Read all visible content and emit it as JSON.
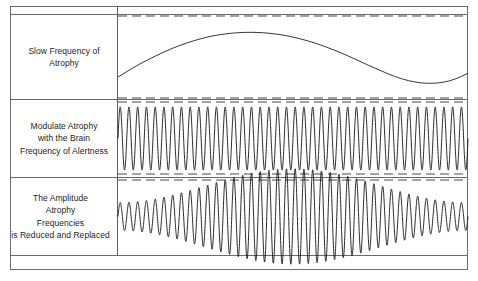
{
  "figure": {
    "frame_color": "#6b6b6b",
    "wave_color": "#141414",
    "guide_color": "#4a4a4a",
    "background": "#ffffff"
  },
  "rows": [
    {
      "id": "slow-frequency",
      "label_lines": [
        "Slow Frequency of",
        "Atrophy"
      ],
      "label": "Slow Frequency of Atrophy",
      "wave": {
        "kind": "sine",
        "cycles": 1,
        "amplitude_rel": 0.38,
        "phase_deg": -90,
        "baseline_rel": 0.5
      },
      "guides": [
        "top",
        "bottom"
      ]
    },
    {
      "id": "brain-frequency-alertness",
      "label_lines": [
        "Modulate Atrophy",
        "with the Brain",
        "Frequency of Alertness"
      ],
      "label": "Modulate Atrophy with the Brain Frequency of Alertness",
      "wave": {
        "kind": "carrier",
        "cycles": 40,
        "amplitude_rel": 0.41,
        "baseline_rel": 0.5
      },
      "guides": [
        "top",
        "bottom"
      ]
    },
    {
      "id": "amplitude-reduced-replaced",
      "label_lines": [
        "The Amplitude",
        "Atrophy",
        "Frequencies",
        "is Reduced and Replaced"
      ],
      "label": "The Amplitude Atrophy Frequencies is Reduced and Replaced",
      "wave": {
        "kind": "amplitude-modulated",
        "carrier_cycles": 40,
        "envelope_cycles": 1,
        "envelope_min_rel": 0.18,
        "envelope_max_rel": 0.62,
        "envelope_phase_deg": -90,
        "baseline_rel": 0.5
      },
      "guides": [
        "top"
      ]
    }
  ],
  "chart_data": {
    "type": "line",
    "xlabel": "",
    "ylabel": "",
    "grid": false,
    "legend": "none",
    "x": [
      0,
      0.25,
      0.5,
      0.75,
      1.0
    ],
    "series": [
      {
        "name": "Slow Frequency of Atrophy",
        "row": 1,
        "description": "One full slow sine cycle: rises from low-left to a broad peak near x=0.3, falls to a trough near x=0.78, then rises again at the right edge.",
        "values": [
          -0.62,
          0.92,
          0.1,
          -0.95,
          -0.2
        ],
        "ylim": [
          -1,
          1
        ]
      },
      {
        "name": "Brain Frequency of Alertness (carrier)",
        "row": 2,
        "description": "Constant-amplitude high-frequency oscillation, approximately 40 cycles across the panel width.",
        "values": [
          1.0,
          1.0,
          1.0,
          1.0,
          1.0
        ],
        "ylim": [
          -1,
          1
        ]
      },
      {
        "name": "Amplitude-Modulated Atrophy Frequencies",
        "row": 3,
        "description": "Carrier of approximately 40 cycles whose envelope follows the slow sine of row 1: small at the left, swelling to a maximum near x=0.3, collapsing to a minimum near x=0.78, then swelling again at the right edge.",
        "envelope": [
          0.22,
          1.0,
          0.55,
          0.18,
          0.9
        ],
        "ylim": [
          -1,
          1
        ]
      }
    ]
  }
}
